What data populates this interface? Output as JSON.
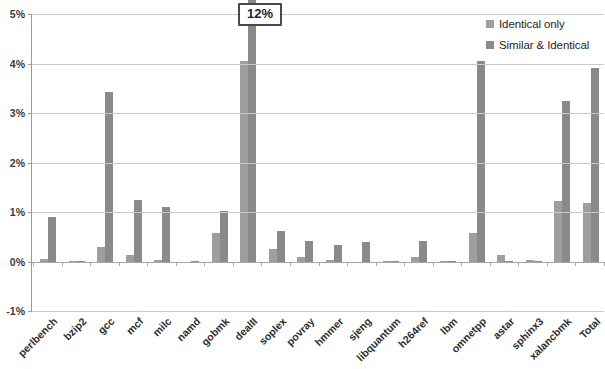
{
  "chart_data": {
    "type": "bar",
    "title": "",
    "subtitle": "",
    "xlabel": "",
    "ylabel": "",
    "ylim": [
      -1,
      5
    ],
    "ytick_labels": [
      "5%",
      "4%",
      "3%",
      "2%",
      "1%",
      "0%",
      "-1%"
    ],
    "ytick_values": [
      5,
      4,
      3,
      2,
      1,
      0,
      -1
    ],
    "grid": true,
    "legend_position": "top-right",
    "value_unit": "%",
    "categories": [
      "perlbench",
      "bzip2",
      "gcc",
      "mcf",
      "milc",
      "namd",
      "gobmk",
      "dealII",
      "soplex",
      "povray",
      "hmmer",
      "sjeng",
      "libquantum",
      "h264ref",
      "lbm",
      "omnetpp",
      "astar",
      "sphinx3",
      "xalancbmk",
      "Total"
    ],
    "series": [
      {
        "name": "Identical only",
        "color": "#9e9e9e",
        "values": [
          0.06,
          0.01,
          0.3,
          0.13,
          0.03,
          0.0,
          0.58,
          4.05,
          0.25,
          0.1,
          0.03,
          -0.04,
          0.01,
          0.1,
          0.01,
          0.57,
          0.13,
          0.03,
          1.22,
          1.18
        ]
      },
      {
        "name": "Similar & Identical",
        "color": "#8a8a8a",
        "values": [
          0.9,
          0.02,
          3.42,
          1.25,
          1.1,
          0.01,
          1.03,
          12.0,
          0.62,
          0.42,
          0.34,
          0.4,
          0.02,
          0.42,
          0.02,
          4.05,
          0.02,
          0.02,
          3.25,
          3.9
        ]
      }
    ],
    "annotations": [
      {
        "text": "12%",
        "category": "dealII",
        "series": "Similar & Identical",
        "note": "bar exceeds axis maximum; value shown in callout box"
      }
    ]
  },
  "legend": {
    "items": [
      {
        "label": "Identical only",
        "color": "#9e9e9e"
      },
      {
        "label": "Similar & Identical",
        "color": "#8a8a8a"
      }
    ]
  }
}
